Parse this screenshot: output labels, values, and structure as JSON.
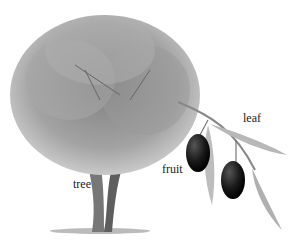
{
  "diagram": {
    "labels": {
      "tree": "tree",
      "fruit": "fruit",
      "leaf": "leaf"
    },
    "colors": {
      "foliage": "#9a9a9a",
      "trunk": "#6e6e6e",
      "fruit": "#1a1a1a",
      "leaf": "#b5b5b5"
    }
  }
}
